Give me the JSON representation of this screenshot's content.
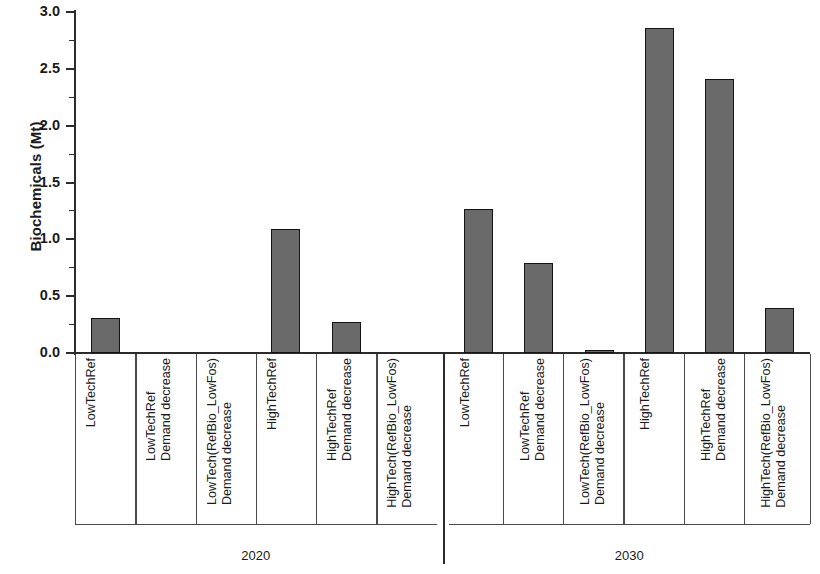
{
  "chart_data": {
    "type": "bar",
    "title": "",
    "subtitle": "",
    "xlabel": "",
    "ylabel": "Biochemicals (Mt)",
    "ylim": [
      0.0,
      3.0
    ],
    "ytick_labels": [
      "0.0",
      "0.5",
      "1.0",
      "1.5",
      "2.0",
      "2.5",
      "3.0"
    ],
    "ytick_values": [
      0.0,
      0.5,
      1.0,
      1.5,
      2.0,
      2.5,
      3.0
    ],
    "minor_ticks": true,
    "grid": false,
    "legend": null,
    "bar_color": "#6a6a6a",
    "bar_edge_color": "#141414",
    "groups": [
      "2020",
      "2030"
    ],
    "categories": [
      "LowTechRef",
      "LowTechRef\nDemand decrease",
      "LowTech(RefBio_LowFos)\nDemand decrease",
      "HighTechRef",
      "HighTechRef\nDemand decrease",
      "HighTech(RefBio_LowFos)\nDemand decrease"
    ],
    "bars": [
      {
        "group": "2020",
        "category_lines": [
          "LowTechRef"
        ],
        "value": 0.31
      },
      {
        "group": "2020",
        "category_lines": [
          "LowTechRef",
          "Demand decrease"
        ],
        "value": 0.0
      },
      {
        "group": "2020",
        "category_lines": [
          "LowTech(RefBio_LowFos)",
          "Demand decrease"
        ],
        "value": 0.0
      },
      {
        "group": "2020",
        "category_lines": [
          "HighTechRef"
        ],
        "value": 1.09
      },
      {
        "group": "2020",
        "category_lines": [
          "HighTechRef",
          "Demand decrease"
        ],
        "value": 0.27
      },
      {
        "group": "2020",
        "category_lines": [
          "HighTech(RefBio_LowFos)",
          "Demand decrease"
        ],
        "value": 0.0
      },
      {
        "group": "2030",
        "category_lines": [
          "LowTechRef"
        ],
        "value": 1.27
      },
      {
        "group": "2030",
        "category_lines": [
          "LowTechRef",
          "Demand decrease"
        ],
        "value": 0.79
      },
      {
        "group": "2030",
        "category_lines": [
          "LowTech(RefBio_LowFos)",
          "Demand decrease"
        ],
        "value": 0.02
      },
      {
        "group": "2030",
        "category_lines": [
          "HighTechRef"
        ],
        "value": 2.86
      },
      {
        "group": "2030",
        "category_lines": [
          "HighTechRef",
          "Demand decrease"
        ],
        "value": 2.41
      },
      {
        "group": "2030",
        "category_lines": [
          "HighTech(RefBio_LowFos)",
          "Demand decrease"
        ],
        "value": 0.4
      }
    ]
  }
}
